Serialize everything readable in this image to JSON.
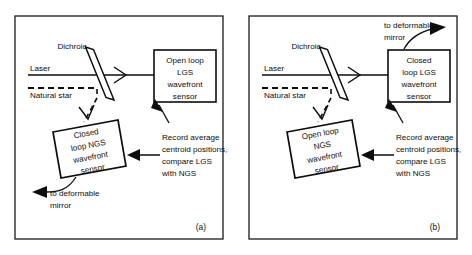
{
  "figure": {
    "background_color": "#ffffff",
    "line_color": "#0d0d0d",
    "panel_border_color": "#1a1a1a"
  },
  "panels": [
    {
      "id": "a",
      "caption": "(a)",
      "source_labels": {
        "laser": "Laser",
        "natural_star": "Natural star"
      },
      "beamsplitter_label": "Dichroic",
      "transmitted_box": {
        "lines": [
          "Open loop",
          "LGS",
          "wavefront",
          "sensor"
        ],
        "shape": "rectangle"
      },
      "reflected_box": {
        "lines": [
          "Closed",
          "loop  NGS",
          "wavefront",
          "sensor"
        ],
        "shape": "tilted-rectangle"
      },
      "annotation": {
        "lines": [
          "Record average",
          "centroid positions,",
          "compare LGS",
          "with NGS"
        ]
      },
      "output_label": {
        "lines": [
          "to deformable",
          "mirror"
        ],
        "from": "reflected_box",
        "direction": "left"
      }
    },
    {
      "id": "b",
      "caption": "(b)",
      "source_labels": {
        "laser": "Laser",
        "natural_star": "Natural star"
      },
      "beamsplitter_label": "Dichroic",
      "transmitted_box": {
        "lines": [
          "Closed",
          "loop  LGS",
          "wavefront",
          "sensor"
        ],
        "shape": "rectangle"
      },
      "reflected_box": {
        "lines": [
          "Open loop",
          "NGS",
          "wavefront",
          "sensor"
        ],
        "shape": "tilted-rectangle"
      },
      "annotation": {
        "lines": [
          "Record average",
          "centroid positions,",
          "compare LGS",
          "with NGS"
        ]
      },
      "output_label": {
        "lines": [
          "to deformable",
          "mirror"
        ],
        "from": "transmitted_box",
        "direction": "up-right"
      }
    }
  ]
}
